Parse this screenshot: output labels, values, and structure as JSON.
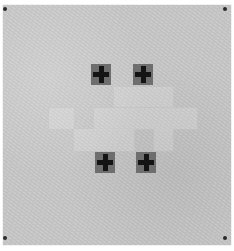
{
  "artwork": {
    "subject": "textured paper with grid of pale squares and four black crosses",
    "colors": {
      "paper": "#c9c9c9",
      "cross": "#141414",
      "cross_square": "#6e6e6e",
      "pin": "#2a2a2a"
    },
    "crosses": [
      {
        "x": 91,
        "y": 64
      },
      {
        "x": 133,
        "y": 64
      },
      {
        "x": 95,
        "y": 152
      },
      {
        "x": 136,
        "y": 152
      }
    ],
    "pale_squares": [
      {
        "x": 113,
        "y": 86,
        "w": 20,
        "h": 20
      },
      {
        "x": 133,
        "y": 86,
        "w": 20,
        "h": 20
      },
      {
        "x": 153,
        "y": 86,
        "w": 19,
        "h": 20
      },
      {
        "x": 48,
        "y": 107,
        "w": 25,
        "h": 21
      },
      {
        "x": 93,
        "y": 107,
        "w": 40,
        "h": 21
      },
      {
        "x": 133,
        "y": 107,
        "w": 40,
        "h": 21
      },
      {
        "x": 173,
        "y": 107,
        "w": 23,
        "h": 21
      },
      {
        "x": 73,
        "y": 128,
        "w": 40,
        "h": 22
      },
      {
        "x": 113,
        "y": 128,
        "w": 20,
        "h": 22
      },
      {
        "x": 153,
        "y": 128,
        "w": 19,
        "h": 22
      }
    ],
    "pins": [
      {
        "x": 3,
        "y": 7
      },
      {
        "x": 223,
        "y": 7
      },
      {
        "x": 3,
        "y": 236
      },
      {
        "x": 223,
        "y": 236
      }
    ]
  }
}
